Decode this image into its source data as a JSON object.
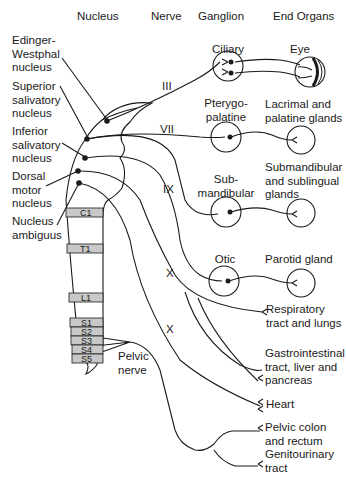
{
  "headers": {
    "nucleus": "Nucleus",
    "nerve": "Nerve",
    "ganglion": "Ganglion",
    "end_organs": "End Organs"
  },
  "nuclei": [
    {
      "label": "Edinger-\nWestphal\nnucleus"
    },
    {
      "label": "Superior\nsalivatory\nnucleus"
    },
    {
      "label": "Inferior\nsalivatory\nnucleus"
    },
    {
      "label": "Dorsal\nmotor\nnucleus"
    },
    {
      "label": "Nucleus\nambiguus"
    }
  ],
  "nerves": {
    "III": "III",
    "VII": "VII",
    "IX": "IX",
    "X_upper": "X",
    "X_lower": "X",
    "pelvic": "Pelvic\nnerve"
  },
  "ganglia": [
    {
      "label": "Ciliary"
    },
    {
      "label": "Pterygo-\npalatine"
    },
    {
      "label": "Sub-\nmandibular"
    },
    {
      "label": "Otic"
    }
  ],
  "end_organs": [
    {
      "label": "Eye"
    },
    {
      "label": "Lacrimal and\npalatine glands"
    },
    {
      "label": "Submandibular\nand sublingual\nglands"
    },
    {
      "label": "Parotid gland"
    },
    {
      "label": "Respiratory\ntract and lungs"
    },
    {
      "label": "Gastrointestinal\ntract, liver and\npancreas"
    },
    {
      "label": "Heart"
    },
    {
      "label": "Pelvic colon\nand rectum"
    },
    {
      "label": "Genitourinary\ntract"
    }
  ],
  "spinal_segments": [
    "C1",
    "T1",
    "L1",
    "S1",
    "S2",
    "S3",
    "S4",
    "S5"
  ],
  "colors": {
    "line": "#1a1a1a",
    "segment_fill": "#c8c8c8",
    "background": "#ffffff"
  }
}
